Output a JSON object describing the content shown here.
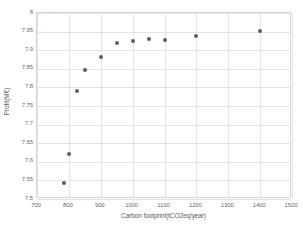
{
  "chart_data": {
    "type": "scatter",
    "title": "",
    "xlabel": "Carbon footprint(tCO2eq/year)",
    "ylabel": "Profit(M€)",
    "xlim": [
      700,
      1500
    ],
    "ylim": [
      7.5,
      8
    ],
    "xticks": [
      700,
      800,
      900,
      1000,
      1100,
      1200,
      1300,
      1400,
      1500
    ],
    "yticks": [
      7.5,
      7.55,
      7.6,
      7.65,
      7.7,
      7.75,
      7.8,
      7.85,
      7.9,
      7.95,
      8
    ],
    "xtick_labels": [
      "700",
      "800",
      "900",
      "1000",
      "1100",
      "1200",
      "1300",
      "1400",
      "1500"
    ],
    "ytick_labels": [
      "7.5",
      "7.55",
      "7.6",
      "7.65",
      "7.7",
      "7.75",
      "7.8",
      "7.85",
      "7.9",
      "7.95",
      "8"
    ],
    "grid": true,
    "legend": false,
    "marker_color": "#5c5c5c",
    "series": [
      {
        "name": "Pareto front",
        "x": [
          785,
          800,
          825,
          850,
          900,
          950,
          1000,
          1050,
          1100,
          1200,
          1400
        ],
        "y": [
          7.543,
          7.622,
          7.789,
          7.848,
          7.883,
          7.92,
          7.925,
          7.93,
          7.927,
          7.937,
          7.951
        ]
      }
    ]
  }
}
